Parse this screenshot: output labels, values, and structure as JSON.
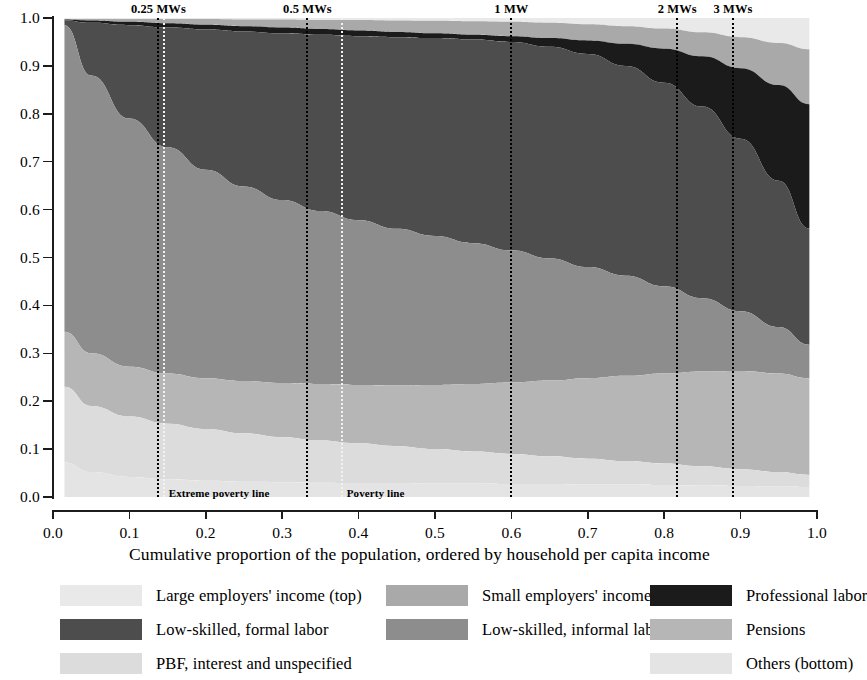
{
  "chart_data": {
    "type": "area",
    "title": "",
    "xlabel": "Cumulative proportion of the population, ordered by household per capita income",
    "ylabel": "",
    "xlim": [
      0.0,
      1.0
    ],
    "ylim": [
      0.0,
      1.0
    ],
    "grid": false,
    "stacked": true,
    "normalized": true,
    "legend_position": "bottom",
    "xticks": [
      "0.0",
      "0.1",
      "0.2",
      "0.3",
      "0.4",
      "0.5",
      "0.6",
      "0.7",
      "0.8",
      "0.9",
      "1.0"
    ],
    "yticks": [
      "0.0",
      "0.1",
      "0.2",
      "0.3",
      "0.4",
      "0.5",
      "0.6",
      "0.7",
      "0.8",
      "0.9",
      "1.0"
    ],
    "x": [
      0.015,
      0.05,
      0.1,
      0.15,
      0.2,
      0.25,
      0.3,
      0.35,
      0.4,
      0.45,
      0.5,
      0.55,
      0.6,
      0.65,
      0.7,
      0.75,
      0.8,
      0.85,
      0.9,
      0.95,
      0.99
    ],
    "series_order_top_to_bottom": [
      "Large employers' income (top)",
      "Small employers' income",
      "Professional labor",
      "Low-skilled, formal labor",
      "Low-skilled, informal labor",
      "Pensions",
      "PBF, interest and unspecified",
      "Others (bottom)"
    ],
    "cumulative_top_boundaries": {
      "note": "Cumulative share (top edge) of each band, top-to-bottom, at each x",
      "large_employers_top": [
        1.0,
        1.0,
        1.0,
        1.0,
        1.0,
        1.0,
        1.0,
        1.0,
        1.0,
        1.0,
        1.0,
        1.0,
        1.0,
        1.0,
        1.0,
        1.0,
        1.0,
        1.0,
        1.0,
        1.0,
        1.0
      ],
      "small_employers_top": [
        0.998,
        0.998,
        0.998,
        0.998,
        0.998,
        0.997,
        0.997,
        0.996,
        0.996,
        0.995,
        0.994,
        0.993,
        0.992,
        0.99,
        0.987,
        0.983,
        0.978,
        0.97,
        0.96,
        0.948,
        0.935
      ],
      "professional_labor_top": [
        0.997,
        0.995,
        0.992,
        0.989,
        0.986,
        0.983,
        0.98,
        0.977,
        0.974,
        0.971,
        0.968,
        0.965,
        0.962,
        0.958,
        0.953,
        0.946,
        0.936,
        0.92,
        0.895,
        0.86,
        0.82
      ],
      "low_skilled_formal_top": [
        0.995,
        0.99,
        0.985,
        0.98,
        0.976,
        0.972,
        0.968,
        0.965,
        0.962,
        0.96,
        0.958,
        0.955,
        0.95,
        0.94,
        0.925,
        0.9,
        0.865,
        0.815,
        0.748,
        0.66,
        0.56
      ],
      "low_skilled_informal_top": [
        0.985,
        0.88,
        0.79,
        0.73,
        0.683,
        0.648,
        0.62,
        0.597,
        0.578,
        0.56,
        0.545,
        0.53,
        0.515,
        0.498,
        0.48,
        0.462,
        0.44,
        0.415,
        0.388,
        0.355,
        0.318
      ],
      "pensions_top": [
        0.345,
        0.3,
        0.272,
        0.258,
        0.248,
        0.242,
        0.238,
        0.236,
        0.234,
        0.233,
        0.234,
        0.236,
        0.239,
        0.243,
        0.248,
        0.253,
        0.258,
        0.262,
        0.263,
        0.258,
        0.248
      ],
      "pbf_interest_top": [
        0.23,
        0.19,
        0.168,
        0.153,
        0.142,
        0.133,
        0.125,
        0.118,
        0.112,
        0.106,
        0.1,
        0.095,
        0.09,
        0.085,
        0.08,
        0.075,
        0.07,
        0.064,
        0.058,
        0.052,
        0.046
      ],
      "others_top": [
        0.072,
        0.052,
        0.042,
        0.037,
        0.034,
        0.032,
        0.031,
        0.03,
        0.029,
        0.029,
        0.028,
        0.028,
        0.027,
        0.027,
        0.026,
        0.026,
        0.025,
        0.024,
        0.023,
        0.022,
        0.021
      ]
    },
    "annotations": {
      "top_lines": [
        {
          "label": "0.25 MWs",
          "x": 0.138
        },
        {
          "label": "0.5 MWs",
          "x": 0.333
        },
        {
          "label": "1 MW",
          "x": 0.6
        },
        {
          "label": "2 MWs",
          "x": 0.817
        },
        {
          "label": "3 MWs",
          "x": 0.89
        }
      ],
      "bottom_lines": [
        {
          "label": "Extreme poverty line",
          "x": 0.145
        },
        {
          "label": "Poverty line",
          "x": 0.378
        }
      ]
    },
    "legend": [
      {
        "label": "Large employers' income (top)",
        "color": "#e9e9e9"
      },
      {
        "label": "Small employers' income",
        "color": "#a9a9a9"
      },
      {
        "label": "Professional labor",
        "color": "#1b1b1b"
      },
      {
        "label": "Low-skilled, formal labor",
        "color": "#4d4d4d"
      },
      {
        "label": "Low-skilled, informal labor",
        "color": "#8d8d8d"
      },
      {
        "label": "Pensions",
        "color": "#b6b6b6"
      },
      {
        "label": "PBF, interest and unspecified",
        "color": "#dcdcdc"
      },
      {
        "label": "Others (bottom)",
        "color": "#e4e4e4"
      }
    ]
  },
  "axes": {
    "x_title": "Cumulative proportion of the population, ordered by household per capita income",
    "x_ticks": [
      "0.0",
      "0.1",
      "0.2",
      "0.3",
      "0.4",
      "0.5",
      "0.6",
      "0.7",
      "0.8",
      "0.9",
      "1.0"
    ],
    "y_ticks": [
      "0.0",
      "0.1",
      "0.2",
      "0.3",
      "0.4",
      "0.5",
      "0.6",
      "0.7",
      "0.8",
      "0.9",
      "1.0"
    ]
  },
  "reference_lines_top": [
    {
      "label": "0.25 MWs"
    },
    {
      "label": "0.5 MWs"
    },
    {
      "label": "1 MW"
    },
    {
      "label": "2 MWs"
    },
    {
      "label": "3 MWs"
    }
  ],
  "reference_lines_bottom": [
    {
      "label": "Extreme poverty line"
    },
    {
      "label": "Poverty line"
    }
  ],
  "legend_items": [
    {
      "label": "Large employers' income (top)"
    },
    {
      "label": "Small employers' income"
    },
    {
      "label": "Professional labor"
    },
    {
      "label": "Low-skilled, formal labor"
    },
    {
      "label": "Low-skilled, informal labor"
    },
    {
      "label": "Pensions"
    },
    {
      "label": "PBF, interest and unspecified"
    },
    {
      "label": "Others (bottom)"
    }
  ]
}
